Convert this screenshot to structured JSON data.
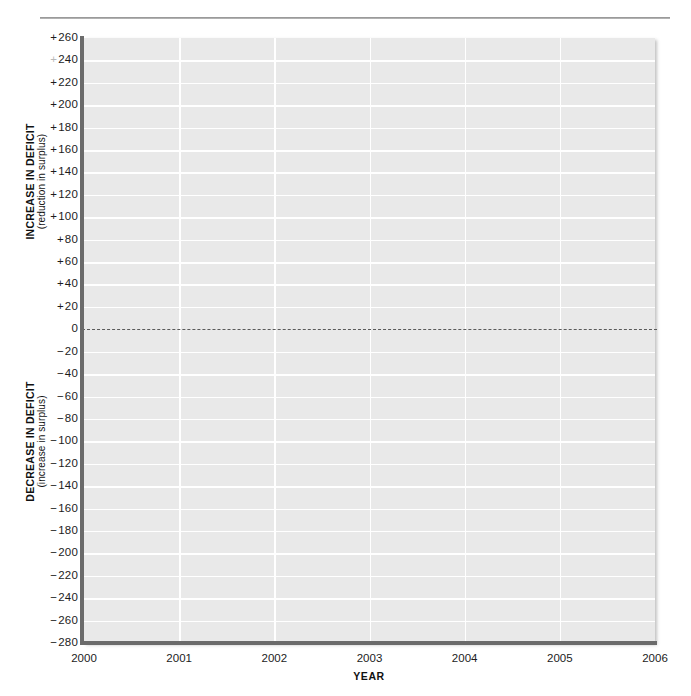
{
  "figure": {
    "name": "deficit-change-blank-grid",
    "has_top_rule": true,
    "plot_background_color": "#e9e9e9",
    "gridline_color": "#ffffff",
    "axis_color": "#6b6b6b",
    "zero_line_color": "#5a5a5a"
  },
  "axis_titles": {
    "y_upper_main": "INCREASE IN DEFICIT",
    "y_upper_sub": "(reduction in surplus)",
    "y_lower_main": "DECREASE IN DEFICIT",
    "y_lower_sub": "(increase in surplus)",
    "x_title": "YEAR"
  },
  "chart_data": {
    "type": "line",
    "title": "",
    "subtitle": "",
    "xlabel": "YEAR",
    "ylabel": "INCREASE IN DEFICIT (reduction in surplus) / DECREASE IN DEFICIT (increase in surplus)",
    "xlim": [
      2000,
      2006
    ],
    "ylim": [
      -280,
      260
    ],
    "grid": true,
    "legend": null,
    "legend_position": "none",
    "series": [],
    "values": [],
    "x": [],
    "annotations": [
      {
        "name": "zero-reference-line",
        "type": "hline",
        "y": 0,
        "style": "dashed"
      }
    ],
    "x_ticks": [
      {
        "value": 2000,
        "label": "2000"
      },
      {
        "value": 2001,
        "label": "2001"
      },
      {
        "value": 2002,
        "label": "2002"
      },
      {
        "value": 2003,
        "label": "2003"
      },
      {
        "value": 2004,
        "label": "2004"
      },
      {
        "value": 2005,
        "label": "2005"
      },
      {
        "value": 2006,
        "label": "2006"
      }
    ],
    "y_ticks": [
      {
        "value": 260,
        "label": "+260"
      },
      {
        "value": 240,
        "label": "+240"
      },
      {
        "value": 220,
        "label": "+220"
      },
      {
        "value": 200,
        "label": "+200"
      },
      {
        "value": 180,
        "label": "+180"
      },
      {
        "value": 160,
        "label": "+160"
      },
      {
        "value": 140,
        "label": "+140"
      },
      {
        "value": 120,
        "label": "+120"
      },
      {
        "value": 100,
        "label": "+100"
      },
      {
        "value": 80,
        "label": "+80"
      },
      {
        "value": 60,
        "label": "+60"
      },
      {
        "value": 40,
        "label": "+40"
      },
      {
        "value": 20,
        "label": "+20"
      },
      {
        "value": 0,
        "label": "0"
      },
      {
        "value": -20,
        "label": "−20"
      },
      {
        "value": -40,
        "label": "−40"
      },
      {
        "value": -60,
        "label": "−60"
      },
      {
        "value": -80,
        "label": "−80"
      },
      {
        "value": -100,
        "label": "−100"
      },
      {
        "value": -120,
        "label": "−120"
      },
      {
        "value": -140,
        "label": "−140"
      },
      {
        "value": -160,
        "label": "−160"
      },
      {
        "value": -180,
        "label": "−180"
      },
      {
        "value": -200,
        "label": "−200"
      },
      {
        "value": -220,
        "label": "−220"
      },
      {
        "value": -240,
        "label": "−240"
      },
      {
        "value": -260,
        "label": "−260"
      },
      {
        "value": -280,
        "label": "−280"
      }
    ]
  }
}
